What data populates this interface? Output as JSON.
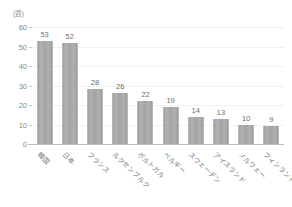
{
  "chart_data": {
    "type": "bar",
    "title": "",
    "subtitle": "",
    "xlabel": "",
    "ylabel": "",
    "unit_label": "(週)",
    "categories": [
      "韓国",
      "日本",
      "フランス",
      "ルクセンブルク",
      "ポルトガル",
      "ベルギー",
      "スウェーデン",
      "アイスランド",
      "ノルウェー",
      "フィンランド"
    ],
    "values": [
      53,
      52,
      28,
      26,
      22,
      19,
      14,
      13,
      10,
      9
    ],
    "value_labels": [
      "53",
      "52",
      "28",
      "26",
      "22",
      "19",
      "14",
      "13",
      "10",
      "9"
    ],
    "ylim": [
      0,
      60
    ],
    "yticks": [
      0,
      10,
      20,
      30,
      40,
      50,
      60
    ],
    "ytick_labels": [
      "0",
      "10",
      "20",
      "30",
      "40",
      "50",
      "60"
    ],
    "grid": true,
    "legend": false,
    "legend_position": "none",
    "series": [
      {
        "name": "",
        "values": [
          53,
          52,
          28,
          26,
          22,
          19,
          14,
          13,
          10,
          9
        ],
        "color": "#a6a6a6"
      }
    ],
    "colors": {
      "bar": "#a6a6a6",
      "gridline": "#f1f1f1",
      "axis": "#bdbdbd",
      "tick_text": "#8a8a8a",
      "value_text": "#6f6f6f",
      "category_text": "#7a7a7a",
      "background": "#ffffff"
    }
  }
}
